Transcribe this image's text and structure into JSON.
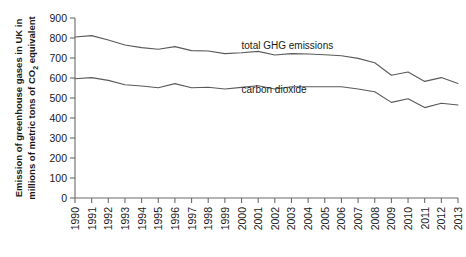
{
  "chart_data": {
    "type": "line",
    "title": "",
    "xlabel": "",
    "ylabel": "Emission of greenhouse gases in UK in millions of metric tons of CO2 equivalent",
    "ylabel_line1": "Emission of greenhouse gases in UK in",
    "ylabel_line2_pre": "millions of metric tons of CO",
    "ylabel_line2_sub": "2",
    "ylabel_line2_post": " equivalent",
    "x": [
      1990,
      1991,
      1992,
      1993,
      1994,
      1995,
      1996,
      1997,
      1998,
      1999,
      2000,
      2001,
      2002,
      2003,
      2004,
      2005,
      2006,
      2007,
      2008,
      2009,
      2010,
      2011,
      2012,
      2013
    ],
    "categories": [
      "1990",
      "1991",
      "1992",
      "1993",
      "1994",
      "1995",
      "1996",
      "1997",
      "1998",
      "1999",
      "2000",
      "2001",
      "2002",
      "2003",
      "2004",
      "2005",
      "2006",
      "2007",
      "2008",
      "2009",
      "2010",
      "2011",
      "2012",
      "2013"
    ],
    "xlim": [
      1990,
      2013
    ],
    "ylim": [
      0,
      900
    ],
    "yticks": [
      0,
      100,
      200,
      300,
      400,
      500,
      600,
      700,
      800,
      900
    ],
    "ytick_labels": [
      "0",
      "100",
      "200",
      "300",
      "400",
      "500",
      "600",
      "700",
      "800",
      "900"
    ],
    "grid": false,
    "legend_position": "inline-annotation",
    "series": [
      {
        "name": "total GHG emissions",
        "color": "#5a5a5a",
        "label_x": 2000,
        "label_y": 745,
        "values": [
          805,
          812,
          790,
          765,
          752,
          744,
          757,
          737,
          735,
          722,
          726,
          733,
          715,
          722,
          720,
          716,
          711,
          698,
          676,
          614,
          630,
          583,
          602,
          573
        ]
      },
      {
        "name": "carbon dioxide",
        "color": "#5a5a5a",
        "label_x": 2000,
        "label_y": 525,
        "values": [
          596,
          602,
          588,
          566,
          560,
          551,
          572,
          551,
          554,
          545,
          553,
          561,
          545,
          556,
          556,
          556,
          556,
          545,
          531,
          478,
          496,
          452,
          474,
          465
        ]
      }
    ],
    "annotations": [
      {
        "text": "total GHG emissions",
        "series": "total GHG emissions"
      },
      {
        "text": "carbon dioxide",
        "series": "carbon dioxide"
      }
    ]
  },
  "colors": {
    "axis": "#6b6b6b",
    "text": "#1a1a1a",
    "line": "#5a5a5a",
    "background": "#ffffff"
  }
}
